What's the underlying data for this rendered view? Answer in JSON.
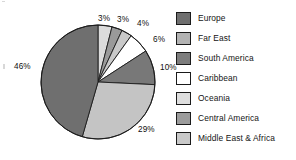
{
  "chart_data": {
    "type": "pie",
    "title": "",
    "legend_position": "right",
    "categories": [
      "Europe",
      "Far East",
      "South America",
      "Caribbean",
      "Oceania",
      "Central America",
      "Middle East & Africa"
    ],
    "values": [
      46,
      29,
      10,
      6,
      4,
      3,
      3
    ],
    "value_unit": "%",
    "labels": [
      "46%",
      "29%",
      "10%",
      "6%",
      "4%",
      "3%",
      "3%"
    ],
    "colors": [
      "#6f6f6f",
      "#c4c4c4",
      "#787878",
      "#ffffff",
      "#dcdcdc",
      "#9a9a9a",
      "#c9c9c9"
    ],
    "slice_order_clockwise_from_top": [
      "Oceania",
      "Central America",
      "Middle East & Africa",
      "Caribbean",
      "South America",
      "Far East",
      "Europe"
    ],
    "slice_label_positions": [
      {
        "label": "3%",
        "x": 98,
        "y": 15
      },
      {
        "label": "3%",
        "x": 117,
        "y": 16
      },
      {
        "label": "4%",
        "x": 137,
        "y": 20
      },
      {
        "label": "6%",
        "x": 153,
        "y": 36
      },
      {
        "label": "10%",
        "x": 160,
        "y": 64
      },
      {
        "label": "29%",
        "x": 138,
        "y": 126
      },
      {
        "label": "46%",
        "x": 14,
        "y": 63
      }
    ]
  },
  "legend": {
    "items": [
      {
        "label": "Europe",
        "color": "#6f6f6f"
      },
      {
        "label": "Far East",
        "color": "#b3b3b3"
      },
      {
        "label": "South America",
        "color": "#7d7d7d"
      },
      {
        "label": "Caribbean",
        "color": "#ffffff"
      },
      {
        "label": "Oceania",
        "color": "#dedede"
      },
      {
        "label": "Central America",
        "color": "#9c9c9c"
      },
      {
        "label": "Middle East & Africa",
        "color": "#c9c9c9"
      }
    ]
  }
}
